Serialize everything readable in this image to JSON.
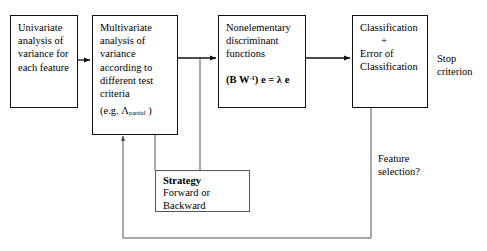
{
  "diagram": {
    "background_color": "#ffffff",
    "line_color": "#111111",
    "nodes": {
      "univariate": {
        "label": "Univariate\nanalysis of\nvariance for\neach feature"
      },
      "multivariate": {
        "label": "Multivariate\nanalysis of\nvariance\naccording to\ndifferent test\ncriteria",
        "criterion_prefix": "(e.g.  ",
        "criterion_symbol": "Λ",
        "criterion_subscript": "partial",
        "criterion_suffix": " )"
      },
      "discriminant": {
        "label": "Nonelementary\ndiscriminant\nfunctions",
        "equation_lead": "(B W",
        "equation_exponent": "-1",
        "equation_tail": ") e = λ e"
      },
      "classification": {
        "line1": "Classification",
        "line2": "+",
        "line3": "Error of",
        "line4": "Classification"
      },
      "strategy": {
        "title": "Strategy",
        "line2": "Forward or",
        "line3": "Backward"
      }
    },
    "annotations": {
      "stop_criterion": "Stop\ncriterion",
      "feature_selection": "Feature\nselection?"
    }
  }
}
